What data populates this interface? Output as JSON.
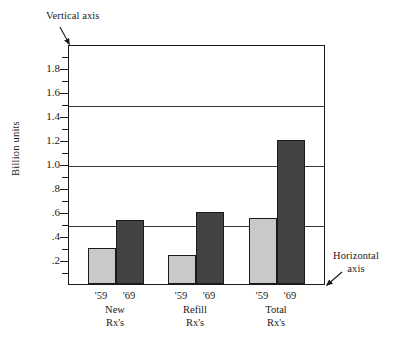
{
  "annotations": {
    "vertical_axis_label": "Vertical axis",
    "horizontal_axis_label": "Horizontal\naxis"
  },
  "chart_data": {
    "type": "bar",
    "title": "",
    "xlabel": "",
    "ylabel": "Billion units",
    "ylim": [
      0,
      2.0
    ],
    "ytick_labels": [
      "1.8",
      "1.6",
      "1.4",
      "1.2",
      "1.0",
      ".8",
      ".6",
      ".4",
      ".2"
    ],
    "ytick_values": [
      1.8,
      1.6,
      1.4,
      1.2,
      1.0,
      0.8,
      0.6,
      0.4,
      0.2
    ],
    "yminor_step": 0.1,
    "gridlines": [
      1.5,
      1.0,
      0.5
    ],
    "grid": true,
    "legend": "none",
    "categories": [
      "New\nRx's",
      "Refill\nRx's",
      "Total\nRx's"
    ],
    "series": [
      {
        "name": "'59",
        "color": "#c9c9c9",
        "values": [
          0.3,
          0.24,
          0.55
        ]
      },
      {
        "name": "'69",
        "color": "#434343",
        "values": [
          0.53,
          0.6,
          1.2
        ]
      }
    ],
    "groups": [
      {
        "group_label": "New\nRx's",
        "bars": [
          {
            "year": "'59",
            "value": 0.3,
            "color": "#c9c9c9"
          },
          {
            "year": "'69",
            "value": 0.53,
            "color": "#434343"
          }
        ]
      },
      {
        "group_label": "Refill\nRx's",
        "bars": [
          {
            "year": "'59",
            "value": 0.24,
            "color": "#c9c9c9"
          },
          {
            "year": "'69",
            "value": 0.6,
            "color": "#434343"
          }
        ]
      },
      {
        "group_label": "Total\nRx's",
        "bars": [
          {
            "year": "'59",
            "value": 0.55,
            "color": "#c9c9c9"
          },
          {
            "year": "'69",
            "value": 1.2,
            "color": "#434343"
          }
        ]
      }
    ]
  }
}
